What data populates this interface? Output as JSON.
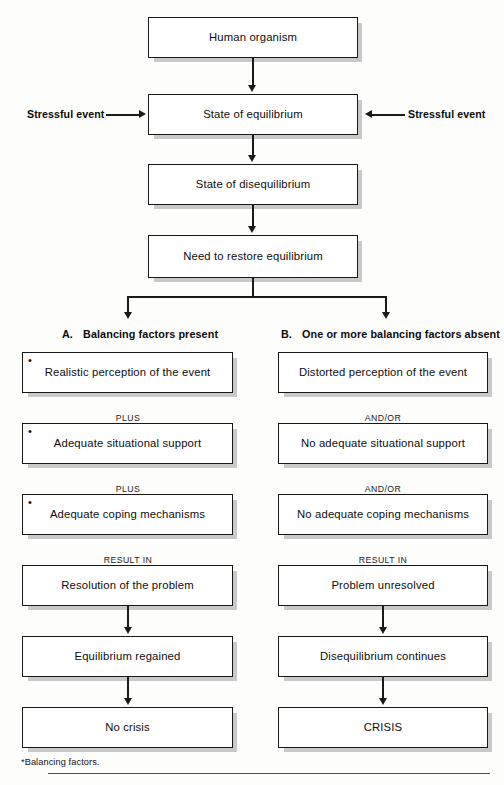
{
  "figure": {
    "type": "flowchart",
    "footnote": "*Balancing factors."
  },
  "trunk": {
    "boxes": [
      {
        "label": "Human organism"
      },
      {
        "label": "State of equilibrium"
      },
      {
        "label": "State of disequilibrium"
      },
      {
        "label": "Need to restore equilibrium"
      }
    ],
    "side_inputs": [
      {
        "label": "Stressful event",
        "side": "left"
      },
      {
        "label": "Stressful event",
        "side": "right"
      }
    ]
  },
  "columns": [
    {
      "letter": "A.",
      "heading": "Balancing factors present",
      "boxes": [
        {
          "label": "Realistic perception of the event",
          "bullet": "•"
        },
        {
          "label": "Adequate situational support",
          "bullet": "•"
        },
        {
          "label": "Adequate coping mechanisms",
          "bullet": "•"
        },
        {
          "label": "Resolution of the problem",
          "bullet": ""
        },
        {
          "label": "Equilibrium  regained",
          "bullet": ""
        },
        {
          "label": "No crisis",
          "bullet": ""
        }
      ],
      "connectors": [
        "PLUS",
        "PLUS",
        "RESULT IN"
      ]
    },
    {
      "letter": "B.",
      "heading": "One or more balancing factors absent",
      "boxes": [
        {
          "label": "Distorted perception of the event",
          "bullet": ""
        },
        {
          "label": "No adequate situational support",
          "bullet": ""
        },
        {
          "label": "No adequate coping mechanisms",
          "bullet": ""
        },
        {
          "label": "Problem unresolved",
          "bullet": ""
        },
        {
          "label": "Disequilibrium continues",
          "bullet": ""
        },
        {
          "label": "CRISIS",
          "bullet": ""
        }
      ],
      "connectors": [
        "AND/OR",
        "AND/OR",
        "RESULT IN"
      ]
    }
  ],
  "colors": {
    "box_border": "#171717",
    "box_fill": "#ffffff",
    "shadow": "#c9c9c9",
    "line": "#1a1a1a",
    "page": "#fdfdfc",
    "rule": "#4a4a55"
  }
}
